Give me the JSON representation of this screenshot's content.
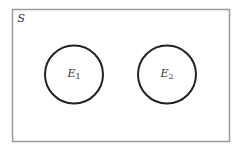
{
  "diagram": {
    "type": "venn",
    "sample_space": {
      "label": "S",
      "rect": {
        "x": 12.5,
        "y": 9.5,
        "width": 217,
        "height": 132
      },
      "stroke": "#9a9a9a"
    },
    "sets": [
      {
        "label_main": "E",
        "label_sub": "1",
        "cx": 74,
        "cy": 74.5,
        "r": 29,
        "stroke": "#222222"
      },
      {
        "label_main": "E",
        "label_sub": "2",
        "cx": 167,
        "cy": 74.5,
        "r": 29,
        "stroke": "#222222"
      }
    ],
    "relationship": "disjoint"
  }
}
